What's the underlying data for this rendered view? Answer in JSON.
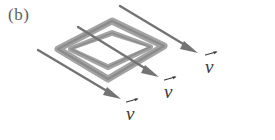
{
  "figure": {
    "panel_label": "(b)",
    "background_color": "#ffffff",
    "loop": {
      "name": "conducting-loop",
      "outer_stroke_color": "#9a9a9a",
      "inner_stroke_color": "#8f8f8f",
      "band_width_px": 7,
      "corners_outer": [
        [
          112,
          21
        ],
        [
          164,
          46
        ],
        [
          108,
          79
        ],
        [
          58,
          49
        ]
      ],
      "corners_inner": [
        [
          112,
          33
        ],
        [
          150,
          47
        ],
        [
          108,
          67
        ],
        [
          71,
          49
        ]
      ]
    },
    "arrows": [
      {
        "name": "velocity-arrow-top",
        "start": [
          120,
          6
        ],
        "end": [
          197,
          52
        ],
        "color": "#6b6b6b",
        "label": "v"
      },
      {
        "name": "velocity-arrow-middle",
        "start": [
          78,
          27
        ],
        "end": [
          158,
          76
        ],
        "color": "#6b6b6b",
        "label": "v"
      },
      {
        "name": "velocity-arrow-bottom",
        "start": [
          38,
          50
        ],
        "end": [
          120,
          98
        ],
        "color": "#6b6b6b",
        "label": "v"
      }
    ],
    "vector_labels": [
      {
        "name": "velocity-label-top",
        "text": "v",
        "x": 205,
        "y": 57
      },
      {
        "name": "velocity-label-middle",
        "text": "v",
        "x": 164,
        "y": 82
      },
      {
        "name": "velocity-label-bottom",
        "text": "v",
        "x": 126,
        "y": 104
      }
    ],
    "caption_color": "#5e5e5e",
    "label_color": "#3a3a3a"
  }
}
